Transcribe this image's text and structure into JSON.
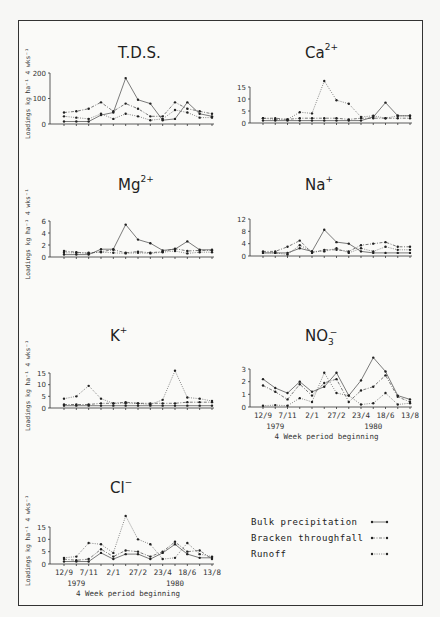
{
  "figure": {
    "legend": [
      {
        "label": "Bulk precipitation",
        "style": "solid"
      },
      {
        "label": "Bracken throughfall",
        "style": "dashdot"
      },
      {
        "label": "Runoff",
        "style": "dotted"
      }
    ],
    "y_axis_label": "Loadings  kg  ha⁻¹ 4 wks⁻¹",
    "x_axis_label": "4 Week period beginning",
    "x_tick_labels": [
      "12/9",
      "7/11",
      "2/1",
      "27/2",
      "23/4",
      "18/6",
      "13/8"
    ],
    "year_labels": [
      "1979",
      "1980"
    ]
  },
  "chart_data": [
    {
      "type": "line",
      "title": "T.D.S.",
      "ylabel": "Loadings kg ha-1 4 wks-1",
      "xlabel": "",
      "ylim": [
        0,
        200
      ],
      "yticks": [
        0,
        100,
        200
      ],
      "x": [
        1,
        2,
        3,
        4,
        5,
        6,
        7,
        8,
        9,
        10,
        11,
        12,
        13
      ],
      "series": [
        {
          "name": "Bulk precipitation",
          "values": [
            10,
            10,
            10,
            35,
            45,
            180,
            95,
            80,
            15,
            20,
            85,
            40,
            30
          ]
        },
        {
          "name": "Bracken throughfall",
          "values": [
            45,
            50,
            60,
            85,
            50,
            80,
            60,
            30,
            30,
            85,
            60,
            50,
            40
          ]
        },
        {
          "name": "Runoff",
          "values": [
            30,
            25,
            20,
            40,
            20,
            40,
            30,
            15,
            20,
            55,
            45,
            25,
            25
          ]
        }
      ]
    },
    {
      "type": "line",
      "title": "Ca2+",
      "ylim": [
        0,
        15
      ],
      "yticks": [
        0,
        5,
        10,
        15
      ],
      "x": [
        1,
        2,
        3,
        4,
        5,
        6,
        7,
        8,
        9,
        10,
        11,
        12,
        13
      ],
      "series": [
        {
          "name": "Bulk precipitation",
          "values": [
            1,
            1,
            1,
            1,
            1,
            1,
            1,
            1,
            1,
            2.5,
            8.5,
            3,
            3
          ]
        },
        {
          "name": "Bracken throughfall",
          "values": [
            2,
            2,
            1.5,
            2,
            2,
            2,
            2,
            1.5,
            2,
            2,
            2,
            2,
            2
          ]
        },
        {
          "name": "Runoff",
          "values": [
            2,
            1.5,
            1.5,
            4.5,
            4,
            17.5,
            9.5,
            8,
            2.5,
            3,
            2,
            3,
            3
          ]
        }
      ]
    },
    {
      "type": "line",
      "title": "Mg2+",
      "ylim": [
        0,
        6
      ],
      "yticks": [
        0,
        2,
        4,
        6
      ],
      "x": [
        1,
        2,
        3,
        4,
        5,
        6,
        7,
        8,
        9,
        10,
        11,
        12,
        13
      ],
      "series": [
        {
          "name": "Bulk precipitation",
          "values": [
            0.4,
            0.4,
            0.4,
            1.3,
            1.3,
            5.4,
            2.9,
            2.3,
            1.1,
            1.3,
            2.6,
            1.2,
            1.2
          ]
        },
        {
          "name": "Bracken throughfall",
          "values": [
            1,
            0.8,
            0.6,
            0.9,
            1.2,
            0.7,
            0.9,
            0.7,
            0.9,
            1.4,
            1,
            1.1,
            1.1
          ]
        },
        {
          "name": "Runoff",
          "values": [
            0.7,
            0.7,
            0.7,
            0.8,
            0.7,
            0.6,
            0.7,
            0.6,
            0.8,
            1,
            0.6,
            0.8,
            0.8
          ]
        }
      ]
    },
    {
      "type": "line",
      "title": "Na+",
      "ylim": [
        0,
        12
      ],
      "yticks": [
        0,
        4,
        8,
        12
      ],
      "x": [
        1,
        2,
        3,
        4,
        5,
        6,
        7,
        8,
        9,
        10,
        11,
        12,
        13
      ],
      "series": [
        {
          "name": "Bulk precipitation",
          "values": [
            1,
            1,
            1,
            2.5,
            1.5,
            8.5,
            4.5,
            4,
            1.5,
            1,
            1,
            1,
            1
          ]
        },
        {
          "name": "Bracken throughfall",
          "values": [
            1.5,
            1.5,
            3,
            5,
            1,
            2,
            2,
            1.5,
            3.5,
            4,
            4.5,
            3,
            3
          ]
        },
        {
          "name": "Runoff",
          "values": [
            1,
            1,
            0.5,
            3.5,
            1.5,
            1.5,
            2.5,
            1,
            2.5,
            1.5,
            3,
            2,
            2
          ]
        }
      ]
    },
    {
      "type": "line",
      "title": "K+",
      "ylim": [
        0,
        15
      ],
      "yticks": [
        0,
        5,
        10,
        15
      ],
      "x": [
        1,
        2,
        3,
        4,
        5,
        6,
        7,
        8,
        9,
        10,
        11,
        12,
        13
      ],
      "series": [
        {
          "name": "Bulk precipitation",
          "values": [
            1,
            1,
            1,
            1,
            1,
            1,
            1,
            1,
            1,
            1,
            1,
            1,
            1
          ]
        },
        {
          "name": "Bracken throughfall",
          "values": [
            1.5,
            1.5,
            1.5,
            2,
            2,
            2.5,
            2,
            2,
            2,
            2,
            2.5,
            2.5,
            2.5
          ]
        },
        {
          "name": "Runoff",
          "values": [
            4,
            5,
            9.5,
            4,
            2,
            2,
            2,
            1.5,
            3.5,
            16,
            4.5,
            4,
            3
          ]
        }
      ]
    },
    {
      "type": "line",
      "title": "NO3-",
      "xlabel": "4 Week period beginning",
      "ylim": [
        0,
        3
      ],
      "yticks": [
        0,
        1,
        2,
        3
      ],
      "x": [
        1,
        2,
        3,
        4,
        5,
        6,
        7,
        8,
        9,
        10,
        11,
        12,
        13
      ],
      "xtick_labels": [
        "12/9",
        "7/11",
        "2/1",
        "27/2",
        "23/4",
        "18/6",
        "13/8"
      ],
      "series": [
        {
          "name": "Bulk precipitation",
          "values": [
            2.2,
            1.5,
            1.1,
            2.0,
            1.2,
            1.6,
            2.7,
            0.9,
            2.1,
            3.9,
            2.8,
            0.9,
            0.6
          ]
        },
        {
          "name": "Bracken throughfall",
          "values": [
            1.7,
            1.2,
            0.6,
            1.8,
            0.9,
            1.9,
            2.2,
            0.4,
            1.3,
            1.6,
            2.5,
            0.8,
            0.4
          ]
        },
        {
          "name": "Runoff",
          "values": [
            0.1,
            0.15,
            0.1,
            0.7,
            0.4,
            2.7,
            1.1,
            0.9,
            0.2,
            0.3,
            1.1,
            0.2,
            0.3
          ]
        }
      ]
    },
    {
      "type": "line",
      "title": "Cl-",
      "xlabel": "4 Week period beginning",
      "ylim": [
        0,
        15
      ],
      "yticks": [
        0,
        5,
        10,
        15
      ],
      "x": [
        1,
        2,
        3,
        4,
        5,
        6,
        7,
        8,
        9,
        10,
        11,
        12,
        13
      ],
      "xtick_labels": [
        "12/9",
        "7/11",
        "2/1",
        "27/2",
        "23/4",
        "18/6",
        "13/8"
      ],
      "series": [
        {
          "name": "Bulk precipitation",
          "values": [
            1,
            1,
            1,
            4.5,
            2,
            4,
            4,
            2,
            4.5,
            8,
            4,
            2.5,
            2.5
          ]
        },
        {
          "name": "Bracken throughfall",
          "values": [
            2,
            1.5,
            2,
            6,
            3,
            5.5,
            5,
            3,
            5,
            9,
            5,
            5.5,
            2
          ]
        },
        {
          "name": "Runoff",
          "values": [
            2.5,
            3,
            8.5,
            8,
            4.5,
            19.5,
            10,
            8,
            2,
            2.5,
            8.5,
            4,
            3
          ]
        }
      ]
    }
  ]
}
